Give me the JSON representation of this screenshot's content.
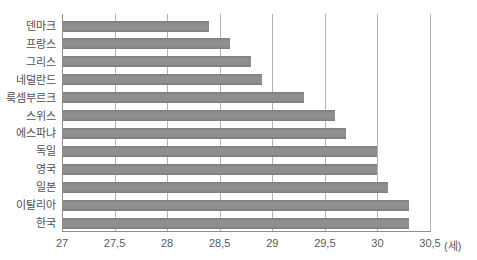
{
  "chart_data": {
    "type": "bar",
    "orientation": "horizontal",
    "title": "",
    "categories": [
      "덴마크",
      "프랑스",
      "그리스",
      "네덜란드",
      "룩셈부르크",
      "스위스",
      "에스파냐",
      "독일",
      "영국",
      "일본",
      "이탈리아",
      "한국"
    ],
    "values": [
      28.4,
      28.6,
      28.8,
      28.9,
      29.3,
      29.6,
      29.7,
      30.0,
      30.0,
      30.1,
      30.3,
      30.3
    ],
    "xlim": [
      27,
      30.5
    ],
    "xticks": [
      27,
      27.5,
      28,
      28.5,
      29,
      29.5,
      30,
      30.5
    ],
    "xtick_labels": [
      "27",
      "27,5",
      "28",
      "28,5",
      "29",
      "29,5",
      "30",
      "30,5"
    ],
    "x_unit_label": "(세)",
    "ylabel": "",
    "xlabel": "",
    "grid": true,
    "legend": false,
    "colors": {
      "bar": "#8a8a8a",
      "gridline": "#b3b3b3",
      "axis": "#8f8f8f",
      "category_text": "#4f4f4f",
      "tick_text": "#5a5a5a",
      "background": "#ffffff"
    }
  }
}
